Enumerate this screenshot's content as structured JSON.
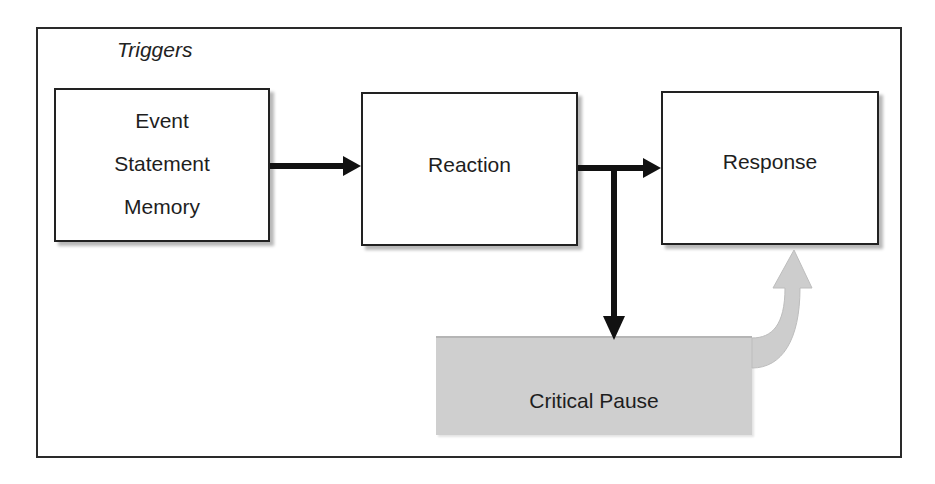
{
  "diagram": {
    "title": "Triggers",
    "nodes": {
      "triggers": {
        "lines": [
          "Event",
          "Statement",
          "Memory"
        ]
      },
      "reaction": {
        "label": "Reaction"
      },
      "response": {
        "label": "Response"
      },
      "critical_pause": {
        "label": "Critical Pause"
      }
    },
    "edges": [
      {
        "from": "triggers",
        "to": "reaction",
        "style": "solid-black-arrow"
      },
      {
        "from": "reaction",
        "to": "response",
        "style": "solid-black-arrow"
      },
      {
        "from": "reaction",
        "to": "critical_pause",
        "style": "solid-black-arrow-branch-down"
      },
      {
        "from": "critical_pause",
        "to": "response",
        "style": "curved-gray-block-arrow"
      }
    ],
    "colors": {
      "stroke": "#222222",
      "box_fill": "#ffffff",
      "pause_fill": "#cfcfcf",
      "curved_arrow_fill": "#cdcdcd",
      "shadow": "#b8b8b8"
    }
  }
}
